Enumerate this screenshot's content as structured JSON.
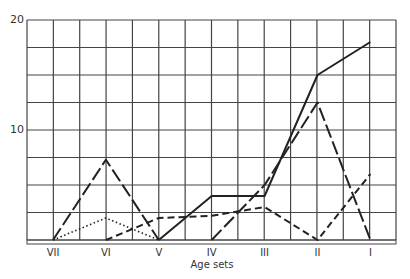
{
  "chart_data": {
    "type": "line",
    "title": "",
    "xlabel": "Age sets",
    "ylabel": "",
    "categories": [
      "VII",
      "VI",
      "V",
      "IV",
      "III",
      "II",
      "I"
    ],
    "ylim": [
      0,
      20
    ],
    "yticks_labeled": [
      10,
      20
    ],
    "grid": true,
    "grid_y_step": 2.5,
    "legend": "none",
    "series": [
      {
        "name": "solid",
        "style": "solid",
        "values": [
          null,
          null,
          0,
          4,
          4,
          15,
          18
        ]
      },
      {
        "name": "long-dash-early",
        "style": "long-dash",
        "values": [
          0,
          7.3,
          0,
          null,
          null,
          null,
          null
        ]
      },
      {
        "name": "long-dash-late",
        "style": "long-dash",
        "values": [
          null,
          null,
          null,
          0,
          5,
          12.5,
          0
        ]
      },
      {
        "name": "medium-dash",
        "style": "medium-dash",
        "values": [
          null,
          0,
          2,
          2.2,
          3,
          0,
          6
        ]
      },
      {
        "name": "dotted",
        "style": "dotted",
        "values": [
          0,
          2,
          0,
          null,
          null,
          null,
          null
        ]
      }
    ]
  },
  "axis": {
    "y_label_20": "20",
    "y_label_10": "10",
    "x_title": "Age sets"
  }
}
